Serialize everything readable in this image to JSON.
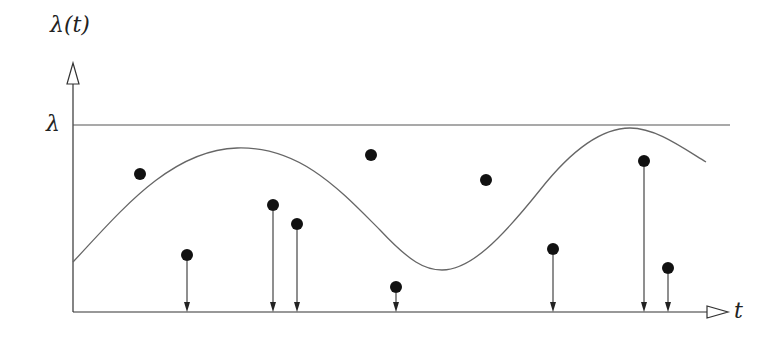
{
  "diagram": {
    "y_axis_label": "λ(t)",
    "x_axis_label": "t",
    "max_rate_label": "λ",
    "colors": {
      "line": "#555555",
      "dot": "#111111",
      "axis": "#333333"
    }
  },
  "chart_data": {
    "type": "scatter",
    "title": "",
    "xlabel": "t",
    "ylabel": "λ(t)",
    "bound_label": "λ",
    "axes_pixels": {
      "origin": [
        73,
        312
      ],
      "x_end": 728,
      "y_top": 63,
      "bound_y": 125
    },
    "curve": [
      [
        73,
        262
      ],
      [
        110,
        220
      ],
      [
        150,
        180
      ],
      [
        200,
        155
      ],
      [
        237,
        148
      ],
      [
        275,
        152
      ],
      [
        320,
        170
      ],
      [
        360,
        205
      ],
      [
        400,
        245
      ],
      [
        442,
        270
      ],
      [
        480,
        258
      ],
      [
        520,
        220
      ],
      [
        560,
        175
      ],
      [
        600,
        140
      ],
      [
        630,
        128
      ],
      [
        660,
        138
      ],
      [
        706,
        162
      ]
    ],
    "rejected_points": [
      [
        140,
        174
      ],
      [
        371,
        155
      ],
      [
        486,
        180
      ]
    ],
    "accepted_points": [
      [
        187,
        255
      ],
      [
        273,
        205
      ],
      [
        297,
        224
      ],
      [
        396,
        287
      ],
      [
        553,
        249
      ],
      [
        644,
        161
      ],
      [
        668,
        268
      ]
    ]
  }
}
